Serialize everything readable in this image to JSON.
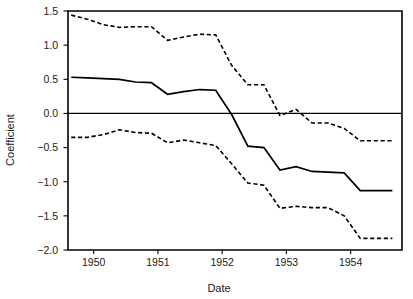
{
  "chart_data": {
    "type": "line",
    "title": "",
    "subtitle": "",
    "xlabel": "Date",
    "ylabel": "Coefficient",
    "xlim": [
      1949.6,
      1954.8
    ],
    "ylim": [
      -2.0,
      1.5
    ],
    "xticks": [
      1950,
      1951,
      1952,
      1953,
      1954
    ],
    "xticklabels": [
      "1950",
      "1951",
      "1952",
      "1953",
      "1954"
    ],
    "yticks": [
      -2.0,
      -1.5,
      -1.0,
      -0.5,
      0.0,
      0.5,
      1.0,
      1.5
    ],
    "yticklabels": [
      "-2.0",
      "-1.5",
      "-1.0",
      "-0.5",
      "0.0",
      "0.5",
      "1.0",
      "1.5"
    ],
    "grid": false,
    "legend": null,
    "reference_lines": [
      {
        "name": "zero-line",
        "orientation": "horizontal",
        "y": 0.0,
        "style": "solid"
      }
    ],
    "x": [
      1949.65,
      1949.9,
      1950.15,
      1950.4,
      1950.65,
      1950.9,
      1951.15,
      1951.4,
      1951.65,
      1951.9,
      1952.15,
      1952.4,
      1952.65,
      1952.9,
      1953.15,
      1953.4,
      1953.65,
      1953.9,
      1954.15,
      1954.4,
      1954.65
    ],
    "series": [
      {
        "name": "Coefficient estimate",
        "style": "solid",
        "values": [
          0.53,
          0.52,
          0.51,
          0.5,
          0.46,
          0.45,
          0.28,
          0.32,
          0.35,
          0.34,
          -0.02,
          -0.48,
          -0.5,
          -0.83,
          -0.78,
          -0.85,
          -0.86,
          -0.87,
          -1.13,
          -1.13,
          -1.13
        ]
      },
      {
        "name": "Upper confidence bound",
        "style": "dashed",
        "values": [
          1.44,
          1.38,
          1.3,
          1.26,
          1.27,
          1.27,
          1.07,
          1.12,
          1.16,
          1.15,
          0.7,
          0.42,
          0.42,
          -0.03,
          0.06,
          -0.14,
          -0.14,
          -0.22,
          -0.4,
          -0.4,
          -0.4
        ]
      },
      {
        "name": "Lower confidence bound",
        "style": "dashed",
        "values": [
          -0.35,
          -0.35,
          -0.31,
          -0.24,
          -0.28,
          -0.29,
          -0.43,
          -0.39,
          -0.43,
          -0.47,
          -0.74,
          -1.02,
          -1.05,
          -1.39,
          -1.36,
          -1.38,
          -1.38,
          -1.5,
          -1.83,
          -1.83,
          -1.83
        ]
      }
    ]
  },
  "colors": {
    "ink": "#000000",
    "background": "#ffffff"
  }
}
